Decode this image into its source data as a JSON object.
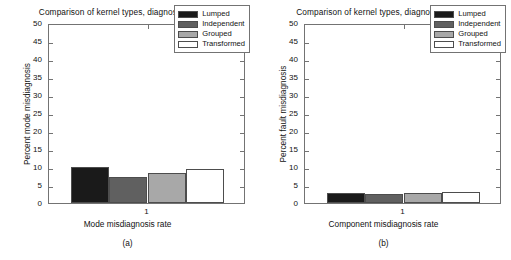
{
  "figure": {
    "caption_a": "(a)",
    "caption_b": "(b)"
  },
  "series_styles": {
    "lumped": "#1a1a1a",
    "independent": "#606060",
    "grouped": "#a8a8a8",
    "transformed": "#ffffff",
    "axis": "#737373",
    "edge": "#4d4d4d"
  },
  "chart_data": [
    {
      "type": "bar",
      "panel": "(a)",
      "title": "Comparison of kernel types, diagnosing modes",
      "xlabel": "Mode misdiagnosis rate",
      "ylabel": "Percent mode misdiagnosis",
      "categories": [
        "Lumped",
        "Independent",
        "Grouped",
        "Transformed"
      ],
      "values": [
        10.0,
        7.3,
        8.4,
        9.4
      ],
      "x_tick_labels": [
        "1"
      ],
      "y_tick_labels": [
        "0",
        "5",
        "10",
        "15",
        "20",
        "25",
        "30",
        "35",
        "40",
        "45",
        "50"
      ],
      "ylim": [
        0,
        50
      ],
      "ytick_step": 5,
      "grid": false,
      "legend_position": "upper right",
      "legend": [
        {
          "label": "Lumped",
          "color": "#1a1a1a"
        },
        {
          "label": "Independent",
          "color": "#606060"
        },
        {
          "label": "Grouped",
          "color": "#a8a8a8"
        },
        {
          "label": "Transformed",
          "color": "#ffffff"
        }
      ]
    },
    {
      "type": "bar",
      "panel": "(b)",
      "title": "Comparison of kernel types, diagnosing states",
      "xlabel": "Component misdiagnosis rate",
      "ylabel": "Percent fault misdiagnosis",
      "categories": [
        "Lumped",
        "Independent",
        "Grouped",
        "Transformed"
      ],
      "values": [
        2.9,
        2.6,
        2.7,
        3.0
      ],
      "x_tick_labels": [
        "1"
      ],
      "y_tick_labels": [
        "0",
        "5",
        "10",
        "15",
        "20",
        "25",
        "30",
        "35",
        "40",
        "45",
        "50"
      ],
      "ylim": [
        0,
        50
      ],
      "ytick_step": 5,
      "grid": false,
      "legend_position": "upper right",
      "legend": [
        {
          "label": "Lumped",
          "color": "#1a1a1a"
        },
        {
          "label": "Independent",
          "color": "#606060"
        },
        {
          "label": "Grouped",
          "color": "#a8a8a8"
        },
        {
          "label": "Transformed",
          "color": "#ffffff"
        }
      ]
    }
  ]
}
